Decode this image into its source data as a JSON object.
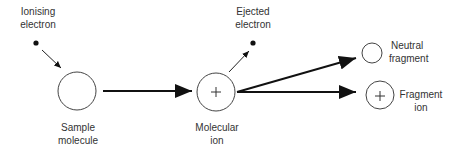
{
  "diagram": {
    "colors": {
      "stroke": "#111111",
      "text": "#333333",
      "circle": "#444444"
    },
    "nodes": {
      "ionising_electron": {
        "line1": "Ionising",
        "line2": "electron"
      },
      "sample_molecule": {
        "line1": "Sample",
        "line2": "molecule"
      },
      "ejected_electron": {
        "line1": "Ejected",
        "line2": "electron"
      },
      "molecular_ion": {
        "line1": "Molecular",
        "line2": "ion",
        "symbol": "+"
      },
      "neutral_fragment": {
        "line1": "Neutral",
        "line2": "fragment"
      },
      "fragment_ion": {
        "line1": "Fragment",
        "line2": "ion",
        "symbol": "+"
      }
    }
  }
}
